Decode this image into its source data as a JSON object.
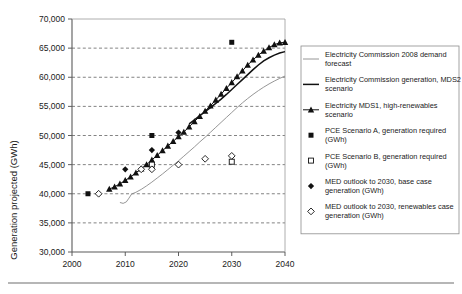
{
  "chart_data": {
    "type": "scatter",
    "title": "",
    "xlabel": "",
    "ylabel": "Generation projected (GWh)",
    "xlim": [
      2000,
      2040
    ],
    "ylim": [
      30000,
      70000
    ],
    "xticks": [
      "2000",
      "2010",
      "2020",
      "2030",
      "2040"
    ],
    "yticks": [
      "30,000",
      "35,000",
      "40,000",
      "45,000",
      "50,000",
      "55,000",
      "60,000",
      "65,000",
      "70,000"
    ],
    "grid": "horizontal-dashed",
    "legend_position": "right",
    "series": [
      {
        "name": "Electricity Commission 2008 demand forecast",
        "marker": "thin-line",
        "style": "thin gray line",
        "x": [
          2009.0,
          2009.6,
          2010.2,
          2010.7,
          2011.2,
          2012,
          2013,
          2014,
          2015,
          2016,
          2017,
          2018,
          2019,
          2020,
          2021,
          2022,
          2023,
          2024,
          2025,
          2026,
          2027,
          2028,
          2029,
          2030,
          2031,
          2032,
          2033,
          2034,
          2035,
          2036,
          2037,
          2038,
          2039,
          2040
        ],
        "values": [
          38500,
          38350,
          38600,
          39250,
          39950,
          40250,
          40750,
          41350,
          42000,
          42700,
          43400,
          44150,
          44900,
          45650,
          46450,
          47250,
          48050,
          48900,
          49700,
          50550,
          51400,
          52250,
          53100,
          53950,
          54800,
          55600,
          56350,
          57050,
          57700,
          58300,
          58850,
          59350,
          59800,
          60200
        ]
      },
      {
        "name": "Electricity Commission generation, MDS2 scenario",
        "marker": "thick-line",
        "style": "thick black line",
        "x": [
          2022,
          2023,
          2024,
          2025,
          2026,
          2027,
          2028,
          2029,
          2030,
          2031,
          2032,
          2033,
          2034,
          2035,
          2036,
          2037,
          2038,
          2039,
          2040
        ],
        "values": [
          52000,
          52700,
          53400,
          54100,
          54800,
          55500,
          56250,
          57050,
          57900,
          58750,
          59600,
          60450,
          61300,
          62100,
          62800,
          63350,
          63800,
          64150,
          64400
        ]
      },
      {
        "name": "Electricity MDS1, high-renewables scenario",
        "marker": "filled-triangle",
        "style": "filled triangles with connecting line",
        "x": [
          2007,
          2008,
          2009,
          2010,
          2011,
          2012,
          2013,
          2014,
          2015,
          2016,
          2017,
          2018,
          2019,
          2020,
          2021,
          2022,
          2023,
          2024,
          2025,
          2026,
          2027,
          2028,
          2029,
          2030,
          2031,
          2032,
          2033,
          2034,
          2035,
          2036,
          2037,
          2038,
          2039,
          2040
        ],
        "values": [
          40800,
          41200,
          41700,
          42300,
          42900,
          43600,
          44300,
          45000,
          45800,
          46600,
          47400,
          48200,
          49000,
          49800,
          50600,
          51500,
          52400,
          53300,
          54200,
          55100,
          56100,
          57100,
          58100,
          59100,
          60100,
          61100,
          62100,
          63000,
          63800,
          64500,
          65100,
          65600,
          65900,
          66000
        ]
      },
      {
        "name": "PCE Scenario A, generation required (GWh)",
        "marker": "filled-square",
        "style": "filled square markers",
        "x": [
          2003,
          2015,
          2030
        ],
        "values": [
          40000,
          50000,
          66000
        ]
      },
      {
        "name": "PCE Scenario B, generation required (GWh)",
        "marker": "open-square",
        "style": "open square markers",
        "x": [
          2015,
          2030
        ],
        "values": [
          45000,
          45500
        ]
      },
      {
        "name": "MED outlook to 2030, base case generation (GWh)",
        "marker": "filled-diamond",
        "style": "filled diamond markers",
        "x": [
          2010,
          2015,
          2020
        ],
        "values": [
          44200,
          47500,
          50500
        ]
      },
      {
        "name": "MED outlook to 2030, renewables case generation (GWh)",
        "marker": "open-diamond",
        "style": "open diamond markers",
        "x": [
          2005,
          2013,
          2015,
          2020,
          2025,
          2030
        ],
        "values": [
          40000,
          44200,
          44200,
          45000,
          46000,
          46500
        ]
      }
    ]
  },
  "legend": {
    "entries": [
      {
        "label": "Electricity Commission 2008 demand forecast",
        "marker": "thin-line"
      },
      {
        "label": "Electricity Commission generation, MDS2 scenario",
        "marker": "thick-line"
      },
      {
        "label": "Electricity MDS1, high-renewables scenario",
        "marker": "filled-triangle"
      },
      {
        "label": "PCE Scenario A, generation required (GWh)",
        "marker": "filled-square"
      },
      {
        "label": "PCE Scenario B, generation required (GWh)",
        "marker": "open-square"
      },
      {
        "label": "MED outlook to 2030, base case generation (GWh)",
        "marker": "filled-diamond"
      },
      {
        "label": "MED outlook to 2030, renewables case generation (GWh)",
        "marker": "open-diamond"
      }
    ]
  },
  "axes": {
    "y_title": "Generation projected (GWh)",
    "y_tick_labels": [
      "70,000",
      "65,000",
      "60,000",
      "55,000",
      "50,000",
      "45,000",
      "40,000",
      "35,000",
      "30,000"
    ],
    "x_tick_labels": [
      "2000",
      "2010",
      "2020",
      "2030",
      "2040"
    ]
  }
}
